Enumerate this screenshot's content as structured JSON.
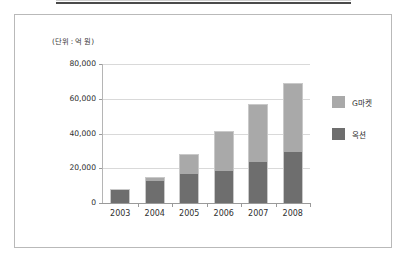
{
  "figure": {
    "unit_label": "(단위 : 억 원)"
  },
  "chart_data": {
    "type": "bar",
    "subtype": "stacked-column",
    "title": "",
    "xlabel": "",
    "ylabel": "",
    "unit_note": "(단위 : 억 원)",
    "categories": [
      "2003",
      "2004",
      "2005",
      "2006",
      "2007",
      "2008"
    ],
    "series": [
      {
        "name": "옥션",
        "color": "#6e6e6e",
        "stack_order": 1,
        "values": [
          7500,
          12500,
          16500,
          18500,
          23500,
          29500
        ]
      },
      {
        "name": "G마켓",
        "color": "#a9a9a9",
        "stack_order": 2,
        "values": [
          500,
          2500,
          11500,
          23000,
          33500,
          39500
        ]
      }
    ],
    "totals": [
      8000,
      15000,
      28000,
      41500,
      57000,
      69000
    ],
    "ylim": [
      0,
      80000
    ],
    "ytick_labels": [
      "0",
      "20,000",
      "40,000",
      "60,000",
      "80,000"
    ],
    "ytick_values": [
      0,
      20000,
      40000,
      60000,
      80000
    ],
    "grid": true,
    "grid_axis": "y",
    "legend_position": "right",
    "legend": [
      "G마켓",
      "옥션"
    ]
  },
  "colors": {
    "series_light": "#a9a9a9",
    "series_dark": "#6e6e6e",
    "gridline": "#d9d9d9",
    "axis": "#9a9a9a",
    "frame": "#b9b9b9",
    "text": "#2f2f2f"
  }
}
